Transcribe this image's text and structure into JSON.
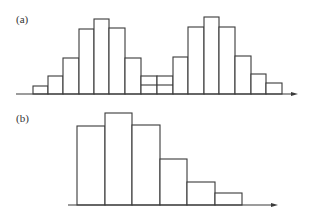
{
  "colors": {
    "stroke": "#3a3a3a",
    "fill": "#ffffff",
    "background": "#ffffff"
  },
  "chart_data": [
    {
      "type": "bar",
      "panel": "(a)",
      "title": "",
      "xlabel": "",
      "ylabel": "",
      "description": "Bimodal histogram with two symmetric peaks; the two central low bins contain an internal horizontal division line.",
      "bar_width_px": 15.6,
      "baseline_y_px": 94,
      "axis": {
        "x_start_px": 16,
        "x_end_px": 298
      },
      "categories": [
        "1",
        "2",
        "3",
        "4",
        "5",
        "6",
        "7",
        "8",
        "9",
        "10",
        "11",
        "12",
        "13",
        "14",
        "15",
        "16"
      ],
      "values": [
        2,
        4,
        7.5,
        13.2,
        15,
        13.3,
        7.5,
        3.8,
        3.8,
        7.5,
        13.3,
        15.2,
        13.3,
        7.6,
        4,
        2
      ],
      "subdivisions": [
        {
          "bin": 8,
          "split_value": 2
        },
        {
          "bin": 9,
          "split_value": 2
        }
      ],
      "bars_px": [
        {
          "x": 33,
          "w": 15,
          "top": 86
        },
        {
          "x": 48,
          "w": 15,
          "top": 76
        },
        {
          "x": 63,
          "w": 16,
          "top": 58
        },
        {
          "x": 79,
          "w": 15,
          "top": 29
        },
        {
          "x": 94,
          "w": 15,
          "top": 19
        },
        {
          "x": 109,
          "w": 16,
          "top": 28
        },
        {
          "x": 125,
          "w": 16,
          "top": 58
        },
        {
          "x": 141,
          "w": 16,
          "top": 76,
          "split": 85
        },
        {
          "x": 157,
          "w": 16,
          "top": 76,
          "split": 85
        },
        {
          "x": 173,
          "w": 15,
          "top": 57
        },
        {
          "x": 188,
          "w": 16,
          "top": 27
        },
        {
          "x": 204,
          "w": 15,
          "top": 17
        },
        {
          "x": 219,
          "w": 16,
          "top": 27
        },
        {
          "x": 235,
          "w": 16,
          "top": 56
        },
        {
          "x": 251,
          "w": 15,
          "top": 74
        },
        {
          "x": 266,
          "w": 16,
          "top": 83
        }
      ]
    },
    {
      "type": "bar",
      "panel": "(b)",
      "title": "",
      "xlabel": "",
      "ylabel": "",
      "description": "Right-skewed unimodal histogram with six bins.",
      "bar_width_px": 27.5,
      "baseline_y_px": 205,
      "axis": {
        "x_start_px": 68,
        "x_end_px": 278
      },
      "categories": [
        "1",
        "2",
        "3",
        "4",
        "5",
        "6"
      ],
      "values": [
        8,
        9,
        8.1,
        4.6,
        2.4,
        1.2
      ],
      "bars_px": [
        {
          "x": 77,
          "w": 28,
          "top": 126
        },
        {
          "x": 105,
          "w": 27,
          "top": 113
        },
        {
          "x": 132,
          "w": 28,
          "top": 125
        },
        {
          "x": 160,
          "w": 27,
          "top": 159
        },
        {
          "x": 187,
          "w": 28,
          "top": 182
        },
        {
          "x": 215,
          "w": 27,
          "top": 193
        }
      ]
    }
  ],
  "labels": {
    "panel_a": "(a)",
    "panel_b": "(b)"
  }
}
